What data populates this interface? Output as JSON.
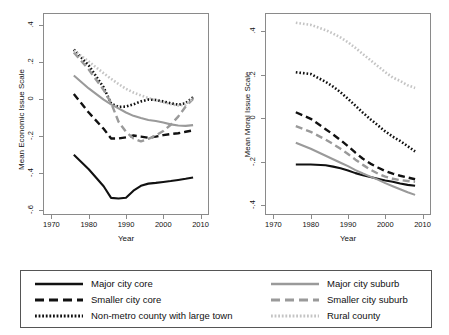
{
  "chart_data": [
    {
      "type": "line",
      "panel": "left",
      "title": "",
      "xlabel": "Year",
      "ylabel": "Mean Economic Issue Scale",
      "xlim": [
        1968,
        2012
      ],
      "ylim": [
        -0.62,
        0.46
      ],
      "xticks": [
        1970,
        1980,
        1990,
        2000,
        2010
      ],
      "xtick_labels": [
        "1970",
        "1980",
        "1990",
        "2000",
        "2010"
      ],
      "yticks": [
        0.4,
        0.2,
        0,
        -0.2,
        -0.4,
        -0.6
      ],
      "ytick_labels": [
        ".4",
        ".2",
        "0",
        "-.2",
        "-.4",
        "-.6"
      ],
      "grid": false,
      "legend_position": "below-figure",
      "x": [
        1976,
        1980,
        1984,
        1986,
        1988,
        1990,
        1992,
        1994,
        1996,
        1998,
        2000,
        2002,
        2004,
        2006,
        2008
      ],
      "series": [
        {
          "name": "Major city core",
          "style": "solid",
          "color": "#111111",
          "values": [
            -0.3,
            -0.378,
            -0.47,
            -0.533,
            -0.536,
            -0.532,
            -0.494,
            -0.468,
            -0.456,
            -0.452,
            -0.447,
            -0.442,
            -0.436,
            -0.43,
            -0.423
          ]
        },
        {
          "name": "Smaller city core",
          "style": "dashed",
          "color": "#111111",
          "values": [
            0.028,
            -0.072,
            -0.16,
            -0.212,
            -0.212,
            -0.206,
            -0.196,
            -0.202,
            -0.208,
            -0.202,
            -0.194,
            -0.188,
            -0.184,
            -0.176,
            -0.168
          ]
        },
        {
          "name": "Non-metro county with large town",
          "style": "dotted",
          "color": "#111111",
          "values": [
            0.268,
            0.182,
            0.064,
            -0.024,
            -0.042,
            -0.04,
            -0.028,
            -0.012,
            -0.002,
            -0.004,
            -0.012,
            -0.022,
            -0.03,
            -0.022,
            0.01
          ]
        },
        {
          "name": "Major city suburb",
          "style": "solid",
          "color": "#9a9a9a",
          "values": [
            0.128,
            0.058,
            -0.002,
            -0.028,
            -0.05,
            -0.072,
            -0.09,
            -0.102,
            -0.112,
            -0.118,
            -0.126,
            -0.136,
            -0.142,
            -0.144,
            -0.14
          ]
        },
        {
          "name": "Smaller city suburb",
          "style": "dashed",
          "color": "#9a9a9a",
          "values": [
            0.252,
            0.16,
            0.05,
            -0.02,
            -0.122,
            -0.176,
            -0.212,
            -0.228,
            -0.214,
            -0.196,
            -0.172,
            -0.138,
            -0.094,
            -0.04,
            0.002
          ]
        },
        {
          "name": "Rural county",
          "style": "dotted",
          "color": "#c4c4c4",
          "values": [
            0.262,
            0.204,
            0.14,
            0.11,
            0.082,
            0.056,
            0.036,
            0.02,
            0.006,
            -0.006,
            -0.016,
            -0.026,
            -0.034,
            -0.03,
            0.006
          ]
        }
      ]
    },
    {
      "type": "line",
      "panel": "right",
      "title": "",
      "xlabel": "Year",
      "ylabel": "Mean Moral Issue Scale",
      "xlim": [
        1968,
        2012
      ],
      "ylim": [
        -0.44,
        0.48
      ],
      "xticks": [
        1970,
        1980,
        1990,
        2000,
        2010
      ],
      "xtick_labels": [
        "1970",
        "1980",
        "1990",
        "2000",
        "2010"
      ],
      "yticks": [
        0.4,
        0.2,
        0,
        -0.2,
        -0.4
      ],
      "ytick_labels": [
        ".4",
        ".2",
        "0",
        "-.2",
        "-.4"
      ],
      "grid": false,
      "legend_position": "below-figure",
      "x": [
        1976,
        1980,
        1984,
        1986,
        1988,
        1990,
        1992,
        1994,
        1996,
        1998,
        2000,
        2002,
        2004,
        2006,
        2008
      ],
      "series": [
        {
          "name": "Major city core",
          "style": "solid",
          "color": "#111111",
          "values": [
            -0.212,
            -0.212,
            -0.216,
            -0.222,
            -0.23,
            -0.24,
            -0.252,
            -0.262,
            -0.27,
            -0.278,
            -0.286,
            -0.292,
            -0.3,
            -0.306,
            -0.31
          ]
        },
        {
          "name": "Smaller city core",
          "style": "dashed",
          "color": "#111111",
          "values": [
            0.028,
            -0.002,
            -0.05,
            -0.074,
            -0.1,
            -0.128,
            -0.158,
            -0.186,
            -0.208,
            -0.226,
            -0.242,
            -0.254,
            -0.264,
            -0.272,
            -0.28
          ]
        },
        {
          "name": "Non-metro county with large town",
          "style": "dotted",
          "color": "#111111",
          "values": [
            0.212,
            0.204,
            0.168,
            0.146,
            0.12,
            0.09,
            0.058,
            0.026,
            -0.004,
            -0.032,
            -0.06,
            -0.084,
            -0.104,
            -0.128,
            -0.152
          ]
        },
        {
          "name": "Major city suburb",
          "style": "solid",
          "color": "#9a9a9a",
          "values": [
            -0.112,
            -0.14,
            -0.172,
            -0.188,
            -0.204,
            -0.22,
            -0.238,
            -0.254,
            -0.268,
            -0.282,
            -0.298,
            -0.312,
            -0.326,
            -0.34,
            -0.352
          ]
        },
        {
          "name": "Smaller city suburb",
          "style": "dashed",
          "color": "#9a9a9a",
          "values": [
            -0.036,
            -0.062,
            -0.098,
            -0.118,
            -0.14,
            -0.164,
            -0.19,
            -0.214,
            -0.236,
            -0.254,
            -0.268,
            -0.278,
            -0.284,
            -0.288,
            -0.292
          ]
        },
        {
          "name": "Rural county",
          "style": "dotted",
          "color": "#c4c4c4",
          "values": [
            0.44,
            0.43,
            0.406,
            0.39,
            0.372,
            0.35,
            0.324,
            0.296,
            0.268,
            0.24,
            0.212,
            0.188,
            0.172,
            0.152,
            0.14
          ]
        }
      ]
    }
  ],
  "legend": {
    "columns": [
      {
        "entries": [
          {
            "label": "Major city core",
            "style": "solid",
            "color": "#111111"
          },
          {
            "label": "Smaller city core",
            "style": "dashed",
            "color": "#111111"
          },
          {
            "label": "Non-metro county with large town",
            "style": "dotted",
            "color": "#111111"
          }
        ]
      },
      {
        "entries": [
          {
            "label": "Major city suburb",
            "style": "solid",
            "color": "#9a9a9a"
          },
          {
            "label": "Smaller city suburb",
            "style": "dashed",
            "color": "#9a9a9a"
          },
          {
            "label": "Rural county",
            "style": "dotted",
            "color": "#c4c4c4"
          }
        ]
      }
    ]
  }
}
